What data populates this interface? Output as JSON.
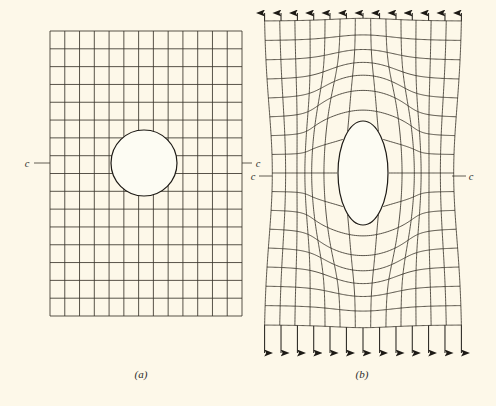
{
  "figure": {
    "background_color": "#fdf8e9",
    "line_color": "#3a352c",
    "hole_fill": "#fdfcf3",
    "panels": [
      {
        "id": "a",
        "caption": "(a)",
        "caption_x": 141,
        "caption_y": 378,
        "state": "undeformed",
        "grid": {
          "x0": 50,
          "y0": 31,
          "x1": 242,
          "y1": 316,
          "columns": 13,
          "rows": 16
        },
        "hole": {
          "shape": "circle",
          "cx": 144,
          "cy": 163,
          "r": 33
        },
        "section_line": {
          "label": "c",
          "y": 163,
          "left_label_x": 27,
          "left_leader_from": 34,
          "left_leader_to": 50,
          "right_label_x": 258,
          "right_leader_from": 242,
          "right_leader_to": 252
        }
      },
      {
        "id": "b",
        "caption": "(b)",
        "caption_x": 362,
        "caption_y": 378,
        "state": "deformed",
        "grid": {
          "x0": 266,
          "y0": 36,
          "x1": 464,
          "y1": 330,
          "columns": 13,
          "rows": 16
        },
        "hole": {
          "shape": "ellipse",
          "cx": 363,
          "cy": 173,
          "rx": 25,
          "ry": 52
        },
        "section_line": {
          "label": "c",
          "y": 176,
          "left_label_x": 253,
          "left_leader_from": 259,
          "left_leader_to": 272,
          "right_label_x": 471,
          "right_leader_from": 452,
          "right_leader_to": 466
        },
        "load": {
          "direction": "uniaxial tension (vertical)",
          "arrow_count_top": 13,
          "arrow_count_bottom": 13,
          "top_arrow_tip_y": 13,
          "bottom_arrow_tip_y": 353
        },
        "deformation": {
          "vertical_stretch": 1.0,
          "lateral_contraction": "necking at mid-height",
          "note": "grid lines bow around the hole; hole elongates into an ellipse"
        }
      }
    ]
  },
  "chart_data": {
    "type": "diagram",
    "panels": [
      {
        "label": "(a)",
        "description": "Plate with circular hole, regular undeformed square grid",
        "grid_columns": 13,
        "grid_rows": 16,
        "hole_radius_px": 33
      },
      {
        "label": "(b)",
        "description": "Same plate under uniaxial tension; grid distorted, hole elongated",
        "grid_columns": 13,
        "grid_rows": 16,
        "hole_semi_minor_px": 25,
        "hole_semi_major_px": 52,
        "load_arrows_top": 13,
        "load_arrows_bottom": 13
      }
    ],
    "annotations": [
      "c",
      "c",
      "c",
      "c"
    ]
  }
}
